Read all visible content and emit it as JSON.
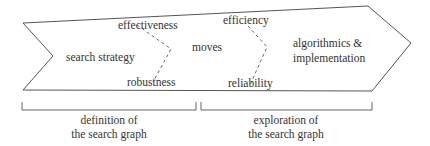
{
  "diagram": {
    "stages": [
      {
        "id": "search-strategy",
        "label": "search strategy"
      },
      {
        "id": "moves",
        "label": "moves"
      },
      {
        "id": "algorithmics",
        "label_line1": "algorithmics &",
        "label_line2": "implementation"
      }
    ],
    "tradeoffs": [
      {
        "top": "effectiveness",
        "bottom": "robustness"
      },
      {
        "top": "efficiency",
        "bottom": "reliability"
      }
    ],
    "brackets": [
      {
        "line1": "definition of",
        "line2": "the search graph"
      },
      {
        "line1": "exploration of",
        "line2": "the search graph"
      }
    ],
    "colors": {
      "stroke": "#555555",
      "text": "#333333"
    }
  }
}
